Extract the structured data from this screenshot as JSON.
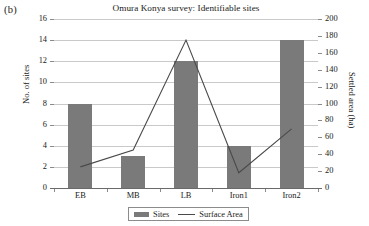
{
  "figure_label": "(b)",
  "axis": {
    "left_title": "No. of sites",
    "right_title": "Settled area (ha)"
  },
  "legend": {
    "sites_label": "Sites",
    "surface_label": "Surface Area"
  },
  "colors": {
    "bar": "#7a7a7a",
    "line": "#4a4a4a",
    "grid": "#c9c9c9",
    "axis": "#6a6a6a",
    "text": "#1a1a1a",
    "background": "#ffffff"
  },
  "chart_data": {
    "type": "bar",
    "title": "Omura Konya survey: Identifiable sites",
    "xlabel": "",
    "ylabel": "No. of sites",
    "y2label": "Settled area (ha)",
    "categories": [
      "EB",
      "MB",
      "LB",
      "Iron1",
      "Iron2"
    ],
    "ylim": [
      0,
      16
    ],
    "yticks": [
      0,
      2,
      4,
      6,
      8,
      10,
      12,
      14,
      16
    ],
    "ytick_labels": [
      "0",
      "2",
      "4",
      "6",
      "8",
      "10",
      "12",
      "14",
      "16"
    ],
    "y2lim": [
      0,
      200
    ],
    "y2ticks": [
      0,
      20,
      40,
      60,
      80,
      100,
      120,
      140,
      160,
      180,
      200
    ],
    "y2tick_labels": [
      "0",
      "20",
      "40",
      "60",
      "80",
      "100",
      "120",
      "140",
      "160",
      "180",
      "200"
    ],
    "grid": true,
    "legend_position": "bottom-center",
    "series": [
      {
        "name": "Sites",
        "type": "bar",
        "axis": "left",
        "color": "#7a7a7a",
        "values": [
          8,
          3,
          12,
          4,
          14
        ]
      },
      {
        "name": "Surface Area",
        "type": "line",
        "axis": "right",
        "color": "#4a4a4a",
        "values": [
          25,
          45,
          175,
          18,
          70
        ]
      }
    ]
  }
}
